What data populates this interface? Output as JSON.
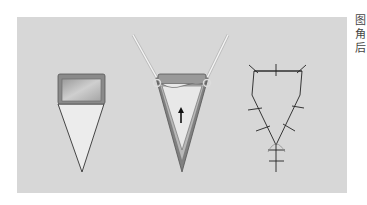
{
  "figure": {
    "background": "#ffffff",
    "panel_color": "#d7d7d7",
    "panels": [
      {
        "name": "flap-design",
        "description": "Rectangular flap on triangular base"
      },
      {
        "name": "flap-advancement",
        "description": "Flap advanced with hooks, arrow indicates direction"
      },
      {
        "name": "flap-closure",
        "description": "Sutured closure, Y-shaped"
      }
    ],
    "arrow_label": "↑",
    "side_text": [
      "图",
      "角",
      "后"
    ]
  }
}
